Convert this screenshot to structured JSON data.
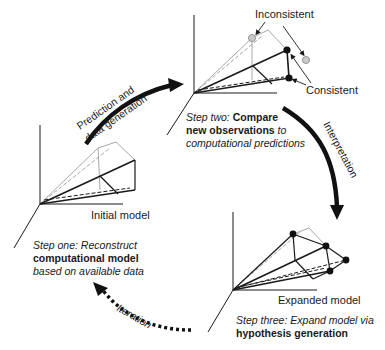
{
  "diagram": {
    "type": "cycle",
    "arrows": {
      "prediction": "Prediction and data generation",
      "prediction_line1": "Prediction and",
      "prediction_line2": "data generation",
      "interpretation": "Interpretation",
      "iteration": "Iteration"
    },
    "models": {
      "initial": {
        "label": "Initial model"
      },
      "compare": {
        "inconsistent_label": "Inconsistent",
        "consistent_label": "Consistent"
      },
      "expanded": {
        "label": "Expanded model"
      }
    },
    "steps": {
      "one": {
        "prefix": "Step one:",
        "l1_rest": " Reconstruct",
        "l2_bold": "computational model",
        "l3": "based on available data"
      },
      "two": {
        "prefix": "Step two:",
        "l1_bold": " Compare",
        "l2_bold": "new observations",
        "l2_rest": " to",
        "l3": "computational predictions"
      },
      "three": {
        "prefix": "Step three:",
        "l1_rest": " Expand model via",
        "l2_bold": "hypothesis generation"
      }
    },
    "colors": {
      "ink": "#1a1a1a",
      "gray_line": "#a8a8a8",
      "gray_dot": "#c8c8c8"
    }
  }
}
